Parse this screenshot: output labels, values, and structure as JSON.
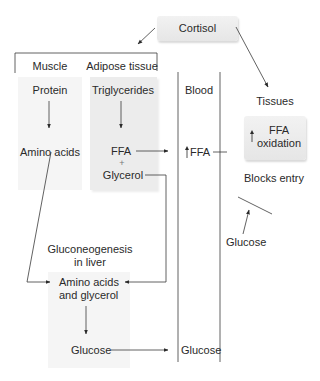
{
  "hormone": {
    "label": "Cortisol"
  },
  "compartments": {
    "muscle": {
      "header": "Muscle",
      "source": "Protein",
      "product": "Amino acids"
    },
    "adipose": {
      "header": "Adipose tissue",
      "source": "Triglycerides",
      "product_1": "FFA",
      "plus": "+",
      "product_2": "Glycerol"
    },
    "blood": {
      "header": "Blood",
      "ffa_label": "FFA",
      "glucose_label": "Glucose"
    },
    "tissues": {
      "header": "Tissues",
      "box_line_1": "FFA",
      "box_line_2": "oxidation",
      "blocks_label": "Blocks entry",
      "glucose_label": "Glucose"
    },
    "liver": {
      "header_line_1": "Gluconeogenesis",
      "header_line_2": "in liver",
      "substrate_line_1": "Amino acids",
      "substrate_line_2": "and glycerol",
      "product": "Glucose"
    }
  },
  "colors": {
    "line": "#3a3a3a",
    "box_light": "#f5f5f5",
    "box_mid": "#ececec",
    "text": "#2a2a2a"
  }
}
